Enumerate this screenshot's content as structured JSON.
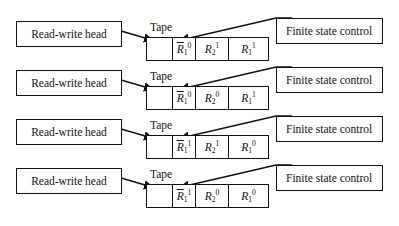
{
  "diagram": {
    "rows": [
      {
        "rw_label": "Read-write head",
        "tape_label": "Tape",
        "fsc_label": "Finite state control",
        "cells": [
          {
            "base": "",
            "bar": false,
            "sub": "",
            "sup": ""
          },
          {
            "base": "R",
            "bar": true,
            "sub": "1",
            "sup": "0"
          },
          {
            "base": "R",
            "bar": false,
            "sub": "2",
            "sup": "1"
          },
          {
            "base": "R",
            "bar": false,
            "sub": "1",
            "sup": "1"
          }
        ]
      },
      {
        "rw_label": "Read-write head",
        "tape_label": "Tape",
        "fsc_label": "Finite state control",
        "cells": [
          {
            "base": "",
            "bar": false,
            "sub": "",
            "sup": ""
          },
          {
            "base": "R",
            "bar": true,
            "sub": "1",
            "sup": "0"
          },
          {
            "base": "R",
            "bar": false,
            "sub": "2",
            "sup": "0"
          },
          {
            "base": "R",
            "bar": false,
            "sub": "1",
            "sup": "1"
          }
        ]
      },
      {
        "rw_label": "Read-write head",
        "tape_label": "Tape",
        "fsc_label": "Finite state control",
        "cells": [
          {
            "base": "",
            "bar": false,
            "sub": "",
            "sup": ""
          },
          {
            "base": "R",
            "bar": true,
            "sub": "1",
            "sup": "1"
          },
          {
            "base": "R",
            "bar": false,
            "sub": "2",
            "sup": "1"
          },
          {
            "base": "R",
            "bar": false,
            "sub": "1",
            "sup": "0"
          }
        ]
      },
      {
        "rw_label": "Read-write head",
        "tape_label": "Tape",
        "fsc_label": "Finite state control",
        "cells": [
          {
            "base": "",
            "bar": false,
            "sub": "",
            "sup": ""
          },
          {
            "base": "R",
            "bar": true,
            "sub": "1",
            "sup": "1"
          },
          {
            "base": "R",
            "bar": false,
            "sub": "2",
            "sup": "0"
          },
          {
            "base": "R",
            "bar": false,
            "sub": "1",
            "sup": "0"
          }
        ]
      }
    ]
  }
}
